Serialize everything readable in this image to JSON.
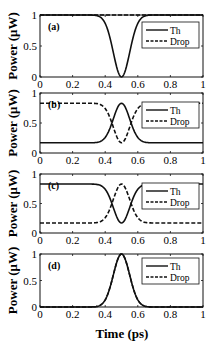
{
  "figure": {
    "xlabel": "Time (ps)",
    "ylabel": "Power (μW)",
    "xticks": [
      0,
      0.2,
      0.4,
      0.6,
      0.8,
      1
    ],
    "xtick_labels": [
      "0",
      "0.2",
      "0.4",
      "0.6",
      "0.8",
      "1"
    ],
    "yticks": [
      0,
      0.5,
      1
    ],
    "ytick_labels": [
      "0",
      "0.5",
      "1"
    ],
    "legend": {
      "entries": [
        {
          "label": "Th",
          "style": "solid"
        },
        {
          "label": "Drop",
          "style": "dashed"
        }
      ]
    },
    "colors": {
      "line": "#111111",
      "frame": "#111111",
      "background": "#ffffff"
    }
  },
  "chart_data": [
    {
      "type": "line",
      "panel_label": "(a)",
      "xlabel": "",
      "ylabel": "Power (μW)",
      "xlim": [
        0,
        1
      ],
      "ylim": [
        0,
        1
      ],
      "grid": false,
      "legend_position": "upper right",
      "x": [
        0,
        0.1,
        0.2,
        0.3,
        0.35,
        0.4,
        0.45,
        0.5,
        0.55,
        0.6,
        0.65,
        0.7,
        0.8,
        0.9,
        1
      ],
      "series": [
        {
          "name": "Th",
          "style": "solid",
          "values": [
            1,
            1,
            1,
            1,
            0.99,
            0.86,
            0.39,
            0,
            0.39,
            0.86,
            0.99,
            1,
            1,
            1,
            1
          ]
        },
        {
          "name": "Drop",
          "style": "dashed",
          "values": [
            1,
            1,
            1,
            1,
            1,
            1,
            1,
            1,
            1,
            1,
            1,
            1,
            1,
            1,
            1
          ]
        }
      ],
      "model": {
        "th_base": 1,
        "th_center": 0,
        "drop_base": 1,
        "drop_center": 1,
        "center": 0.5,
        "sigma": 0.05
      }
    },
    {
      "type": "line",
      "panel_label": "(b)",
      "xlabel": "",
      "ylabel": "Power (μW)",
      "xlim": [
        0,
        1
      ],
      "ylim": [
        0,
        1
      ],
      "grid": false,
      "legend_position": "right",
      "x": [
        0,
        0.1,
        0.2,
        0.3,
        0.35,
        0.4,
        0.45,
        0.5,
        0.55,
        0.6,
        0.65,
        0.7,
        0.8,
        0.9,
        1
      ],
      "series": [
        {
          "name": "Th",
          "style": "solid",
          "values": [
            0.17,
            0.17,
            0.17,
            0.17,
            0.18,
            0.26,
            0.57,
            0.83,
            0.57,
            0.26,
            0.18,
            0.17,
            0.17,
            0.17,
            0.17
          ]
        },
        {
          "name": "Drop",
          "style": "dashed",
          "values": [
            0.83,
            0.83,
            0.83,
            0.83,
            0.82,
            0.74,
            0.43,
            0.17,
            0.43,
            0.74,
            0.82,
            0.83,
            0.83,
            0.83,
            0.83
          ]
        }
      ],
      "model": {
        "th_base": 0.17,
        "th_center": 0.83,
        "drop_base": 0.83,
        "drop_center": 0.17,
        "center": 0.5,
        "sigma": 0.05
      }
    },
    {
      "type": "line",
      "panel_label": "(c)",
      "xlabel": "",
      "ylabel": "Power (μW)",
      "xlim": [
        0,
        1
      ],
      "ylim": [
        0,
        1
      ],
      "grid": false,
      "legend_position": "right",
      "x": [
        0,
        0.1,
        0.2,
        0.3,
        0.35,
        0.4,
        0.45,
        0.5,
        0.55,
        0.6,
        0.65,
        0.7,
        0.8,
        0.9,
        1
      ],
      "series": [
        {
          "name": "Th",
          "style": "solid",
          "values": [
            0.83,
            0.83,
            0.83,
            0.83,
            0.82,
            0.74,
            0.43,
            0.17,
            0.43,
            0.74,
            0.82,
            0.83,
            0.83,
            0.83,
            0.83
          ]
        },
        {
          "name": "Drop",
          "style": "dashed",
          "values": [
            0.17,
            0.17,
            0.17,
            0.17,
            0.18,
            0.26,
            0.57,
            0.83,
            0.57,
            0.26,
            0.18,
            0.17,
            0.17,
            0.17,
            0.17
          ]
        }
      ],
      "model": {
        "th_base": 0.83,
        "th_center": 0.17,
        "drop_base": 0.17,
        "drop_center": 0.83,
        "center": 0.5,
        "sigma": 0.05
      }
    },
    {
      "type": "line",
      "panel_label": "(d)",
      "xlabel": "Time (ps)",
      "ylabel": "Power (μW)",
      "xlim": [
        0,
        1
      ],
      "ylim": [
        0,
        1
      ],
      "grid": false,
      "legend_position": "upper right",
      "x": [
        0,
        0.1,
        0.2,
        0.3,
        0.35,
        0.4,
        0.45,
        0.5,
        0.55,
        0.6,
        0.65,
        0.7,
        0.8,
        0.9,
        1
      ],
      "series": [
        {
          "name": "Th",
          "style": "solid",
          "values": [
            0,
            0,
            0,
            0,
            0.01,
            0.14,
            0.61,
            1,
            0.61,
            0.14,
            0.01,
            0,
            0,
            0,
            0
          ]
        },
        {
          "name": "Drop",
          "style": "dashed",
          "values": [
            0,
            0,
            0,
            0,
            0.01,
            0.14,
            0.61,
            1,
            0.61,
            0.14,
            0.01,
            0,
            0,
            0,
            0
          ]
        }
      ],
      "model": {
        "th_base": 0,
        "th_center": 1,
        "drop_base": 0,
        "drop_center": 1,
        "center": 0.5,
        "sigma": 0.05
      }
    }
  ]
}
